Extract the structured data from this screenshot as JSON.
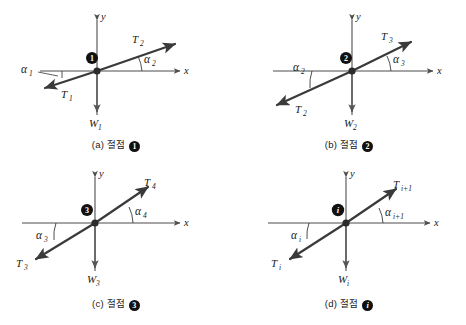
{
  "figure": {
    "type": "free-body-diagram-grid",
    "panel_count": 4,
    "axis_labels": {
      "x": "x",
      "y": "y"
    },
    "colors": {
      "background": "#ffffff",
      "axis": "#4d4d4d",
      "force_vector": "#3a3a3a",
      "node_marker": "#111111",
      "text": "#1a1a1a"
    }
  },
  "panels": [
    {
      "id": "panel-a",
      "caption_prefix": "(a)",
      "caption_word": "절점",
      "node_glyph": "1",
      "node_badge": "1",
      "axis_x": "x",
      "axis_y": "y",
      "vectors": [
        {
          "name": "T2",
          "label": "T",
          "sub": "2",
          "direction": "up-right"
        },
        {
          "name": "T1",
          "label": "T",
          "sub": "1",
          "direction": "down-left"
        },
        {
          "name": "W1",
          "label": "W",
          "sub": "1",
          "direction": "down"
        }
      ],
      "angles": [
        {
          "name": "alpha2",
          "label": "α",
          "sub": "2",
          "side": "right"
        },
        {
          "name": "alpha1",
          "label": "α",
          "sub": "1",
          "side": "left"
        }
      ]
    },
    {
      "id": "panel-b",
      "caption_prefix": "(b)",
      "caption_word": "절점",
      "node_glyph": "2",
      "node_badge": "2",
      "axis_x": "x",
      "axis_y": "y",
      "vectors": [
        {
          "name": "T3",
          "label": "T",
          "sub": "3",
          "direction": "up-right"
        },
        {
          "name": "T2",
          "label": "T",
          "sub": "2",
          "direction": "down-left"
        },
        {
          "name": "W2",
          "label": "W",
          "sub": "2",
          "direction": "down"
        }
      ],
      "angles": [
        {
          "name": "alpha3",
          "label": "α",
          "sub": "3",
          "side": "right"
        },
        {
          "name": "alpha2",
          "label": "α",
          "sub": "2",
          "side": "left"
        }
      ]
    },
    {
      "id": "panel-c",
      "caption_prefix": "(c)",
      "caption_word": "절점",
      "node_glyph": "3",
      "node_badge": "3",
      "axis_x": "x",
      "axis_y": "y",
      "vectors": [
        {
          "name": "T4",
          "label": "T",
          "sub": "4",
          "direction": "up-right"
        },
        {
          "name": "T3",
          "label": "T",
          "sub": "3",
          "direction": "down-left"
        },
        {
          "name": "W3",
          "label": "W",
          "sub": "3",
          "direction": "down"
        }
      ],
      "angles": [
        {
          "name": "alpha4",
          "label": "α",
          "sub": "4",
          "side": "right"
        },
        {
          "name": "alpha3",
          "label": "α",
          "sub": "3",
          "side": "left"
        }
      ]
    },
    {
      "id": "panel-d",
      "caption_prefix": "(d)",
      "caption_word": "절점",
      "node_glyph": "i",
      "node_badge": "i",
      "axis_x": "x",
      "axis_y": "y",
      "vectors": [
        {
          "name": "Ti1",
          "label": "T",
          "sub": "i+1",
          "direction": "up-right"
        },
        {
          "name": "Ti",
          "label": "T",
          "sub": "i",
          "direction": "down-left"
        },
        {
          "name": "Wi",
          "label": "W",
          "sub": "i",
          "direction": "down"
        }
      ],
      "angles": [
        {
          "name": "alphai1",
          "label": "α",
          "sub": "i+1",
          "side": "right"
        },
        {
          "name": "alphai",
          "label": "α",
          "sub": "i",
          "side": "left"
        }
      ]
    }
  ]
}
